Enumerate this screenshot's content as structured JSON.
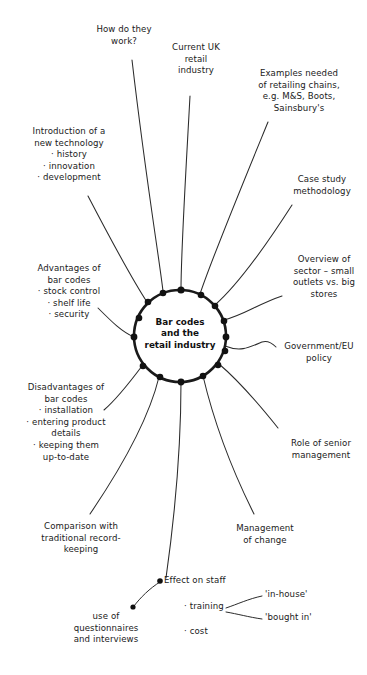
{
  "diagram": {
    "type": "mind-map",
    "title": "Bar codes and the retail industry",
    "hub": {
      "text": "Bar codes\nand the\nretail industry",
      "center_x": 180,
      "center_y": 336,
      "radius": 46
    },
    "branches": [
      {
        "id": "how-do-they-work",
        "text": "How do they\nwork?",
        "align": "center",
        "x": 78,
        "y": 24,
        "width": 92
      },
      {
        "id": "current-uk-retail-industry",
        "text": "Current UK\nretail\nindustry",
        "align": "center",
        "x": 160,
        "y": 42,
        "width": 72
      },
      {
        "id": "examples-needed-retailing-chains",
        "text": "Examples needed\nof retailing chains,\ne.g. M&S, Boots,\nSainsbury's",
        "align": "center",
        "x": 238,
        "y": 68,
        "width": 122
      },
      {
        "id": "case-study-methodology",
        "text": "Case study\nmethodology",
        "align": "center",
        "x": 281,
        "y": 174,
        "width": 82
      },
      {
        "id": "overview-of-sector",
        "text": "Overview of\nsector – small\noutlets vs. big\nstores",
        "align": "center",
        "x": 283,
        "y": 254,
        "width": 82
      },
      {
        "id": "government-eu-policy",
        "text": "Government/EU\npolicy",
        "align": "center",
        "x": 272,
        "y": 341,
        "width": 94
      },
      {
        "id": "role-of-senior-management",
        "text": "Role of senior\nmanagement",
        "align": "center",
        "x": 276,
        "y": 438,
        "width": 90
      },
      {
        "id": "management-of-change",
        "text": "Management\nof change",
        "align": "center",
        "x": 226,
        "y": 523,
        "width": 78
      },
      {
        "id": "effect-on-staff",
        "text": "Effect on staff",
        "align": "left",
        "x": 164,
        "y": 580,
        "width": 90
      },
      {
        "id": "comparison-traditional-record-keeping",
        "text": "Comparison with\ntraditional record-\nkeeping",
        "align": "center",
        "x": 27,
        "y": 521,
        "width": 108
      },
      {
        "id": "disadvantages-of-bar-codes",
        "text": "Disadvantages of\nbar codes\n· installation\n· entering product\ndetails\n· keeping them\nup-to-date",
        "align": "center",
        "x": 8,
        "y": 382,
        "width": 116
      },
      {
        "id": "advantages-of-bar-codes",
        "text": "Advantages of\nbar codes\n· stock control\n· shelf life\n· security",
        "align": "center",
        "x": 14,
        "y": 263,
        "width": 110
      },
      {
        "id": "introduction-of-new-technology",
        "text": "Introduction of a\nnew technology\n· history\n· innovation\n· development",
        "align": "center",
        "x": 10,
        "y": 126,
        "width": 118
      }
    ],
    "sub_nodes": [
      {
        "id": "use-of-questionnaires",
        "text": "use of\nquestionnaires\nand interviews",
        "align": "center",
        "x": 60,
        "y": 617,
        "width": 92
      },
      {
        "id": "training",
        "text": "· training",
        "align": "left",
        "x": 184,
        "y": 603,
        "width": 60
      },
      {
        "id": "cost",
        "text": "· cost",
        "align": "left",
        "x": 184,
        "y": 628,
        "width": 50
      },
      {
        "id": "in-house",
        "text": "'in-house'",
        "align": "left",
        "x": 265,
        "y": 595,
        "width": 60
      },
      {
        "id": "bought-in",
        "text": "'bought in'",
        "align": "left",
        "x": 265,
        "y": 614,
        "width": 62
      }
    ],
    "colors": {
      "ink": "#1a1a1a",
      "background": "#ffffff",
      "node_dot": "#111111"
    }
  }
}
